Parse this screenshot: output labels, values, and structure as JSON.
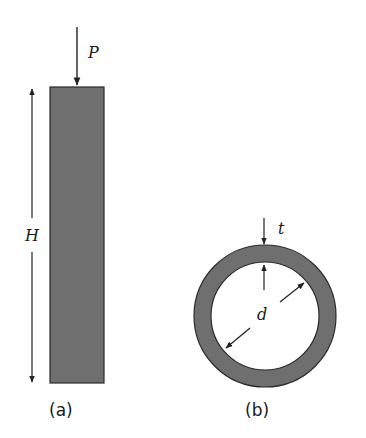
{
  "figure": {
    "colors": {
      "fill": "#6f6f6f",
      "stroke": "#2a2a2a",
      "line": "#222222"
    },
    "panel_a": {
      "caption": "(a)",
      "load_label": "P",
      "height_label": "H",
      "description": "Solid column under axial compressive load P with height H"
    },
    "panel_b": {
      "caption": "(b)",
      "thickness_label": "t",
      "diameter_label": "d",
      "description": "Hollow circular cross-section with wall thickness t and inner diameter d"
    }
  }
}
